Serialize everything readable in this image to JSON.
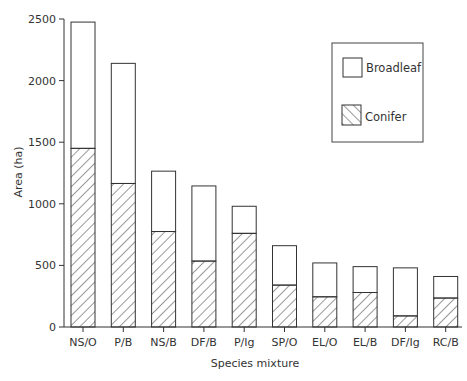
{
  "chart_data": {
    "type": "bar",
    "stacked": true,
    "title": "",
    "xlabel": "Species mixture",
    "ylabel": "Area (ha)",
    "ylim": [
      0,
      2500
    ],
    "yticks": [
      0,
      500,
      1000,
      1500,
      2000,
      2500
    ],
    "grid": false,
    "legend_position": "top-right",
    "categories": [
      "NS/O",
      "P/B",
      "NS/B",
      "DF/B",
      "P/Ig",
      "SP/O",
      "EL/O",
      "EL/B",
      "DF/Ig",
      "RC/B"
    ],
    "series": [
      {
        "name": "Conifer",
        "pattern": "hatched",
        "values": [
          1450,
          1165,
          775,
          535,
          760,
          340,
          245,
          280,
          90,
          235
        ]
      },
      {
        "name": "Broadleaf",
        "pattern": "open",
        "values": [
          1025,
          975,
          490,
          610,
          220,
          320,
          275,
          210,
          390,
          175
        ]
      }
    ],
    "totals": [
      2475,
      2140,
      1265,
      1145,
      980,
      660,
      520,
      490,
      480,
      410
    ],
    "legend": [
      "Broadleaf",
      "Conifer"
    ]
  }
}
